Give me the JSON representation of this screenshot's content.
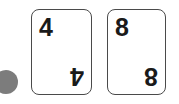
{
  "canvas": {
    "width": 179,
    "height": 104,
    "background_color": "#ffffff"
  },
  "token": {
    "shape": "circle",
    "color": "#7c7c7c",
    "label": ""
  },
  "cards": [
    {
      "rank_top_left": "4",
      "rank_bottom_right": "4",
      "face_color": "#ffffff",
      "border_color": "#4a4a4a",
      "text_color": "#1a1a1a"
    },
    {
      "rank_top_left": "8",
      "rank_bottom_right": "8",
      "face_color": "#ffffff",
      "border_color": "#4a4a4a",
      "text_color": "#1a1a1a"
    }
  ]
}
